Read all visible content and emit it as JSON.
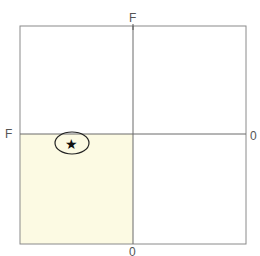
{
  "diagram": {
    "type": "quadrant-grid",
    "labels": {
      "top": "F",
      "left": "F",
      "right": "0",
      "bottom": "0"
    },
    "highlighted_quadrant": "bottom-left",
    "colors": {
      "frame": "#8a8a8a",
      "highlight_fill": "#fcfae3",
      "marker": "#111111"
    },
    "marker": {
      "icon": "star-icon",
      "glyph": "★",
      "enclosed_in": "ellipse"
    }
  }
}
